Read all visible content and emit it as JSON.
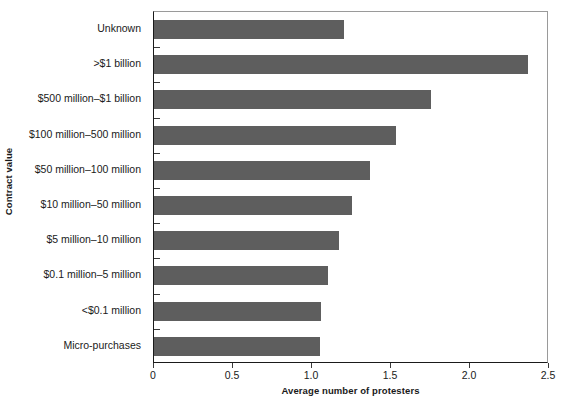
{
  "chart_data": {
    "type": "bar",
    "orientation": "horizontal",
    "title": "",
    "xlabel": "Average number of protesters",
    "ylabel": "Contract value",
    "xlim": [
      0,
      2.5
    ],
    "xticks": [
      "0",
      "0.5",
      "1.0",
      "1.5",
      "2.0",
      "2.5"
    ],
    "xtick_values": [
      0,
      0.5,
      1.0,
      1.5,
      2.0,
      2.5
    ],
    "grid": false,
    "legend": null,
    "bar_color": "#5e5e5e",
    "categories": [
      "Unknown",
      ">$1 billion",
      "$500 million–$1 billion",
      "$100 million–500 million",
      "$50 million–100 million",
      "$10 million–50 million",
      "$5 million–10 million",
      "$0.1 million–5 million",
      "<$0.1 million",
      "Micro-purchases"
    ],
    "values": [
      1.2,
      2.37,
      1.75,
      1.53,
      1.37,
      1.25,
      1.17,
      1.1,
      1.06,
      1.05
    ]
  }
}
